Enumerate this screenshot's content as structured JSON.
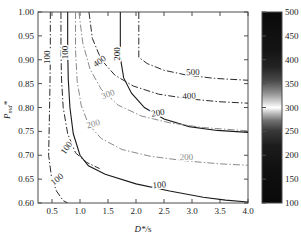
{
  "figure": {
    "background": "#ffffff",
    "axes_color": "#4d4d4d"
  },
  "chart_data": {
    "type": "line",
    "subtype": "contour",
    "title": "",
    "xlabel": "D*/s",
    "ylabel": "Pmd*",
    "xlim": [
      0.25,
      4.0
    ],
    "ylim": [
      0.6,
      1.0
    ],
    "grid": false,
    "xticks": [
      0.5,
      1.0,
      1.5,
      2.0,
      2.5,
      3.0,
      3.5,
      4.0
    ],
    "xtick_labels": [
      "0.5",
      "1.0",
      "1.5",
      "2.0",
      "2.5",
      "3.0",
      "3.5",
      "4.0"
    ],
    "yticks": [
      0.6,
      0.65,
      0.7,
      0.75,
      0.8,
      0.85,
      0.9,
      0.95,
      1.0
    ],
    "ytick_labels": [
      "0.60",
      "0.65",
      "0.70",
      "0.75",
      "0.80",
      "0.85",
      "0.90",
      "0.95",
      "1.00"
    ],
    "colorbar": {
      "min": 100,
      "max": 500,
      "ticks": [
        100,
        150,
        200,
        250,
        300,
        350,
        400,
        450,
        500
      ],
      "tick_labels": [
        "100",
        "150",
        "200",
        "250",
        "300",
        "350",
        "400",
        "450",
        "500"
      ],
      "colormap": "gray-banded",
      "highlight_value": 295
    },
    "series": [
      {
        "name": "contour-100-dashdot-left",
        "level": 100,
        "style": "dash-dot",
        "color": "#2b2b2b",
        "label": "100",
        "points": [
          [
            0.47,
            1.0
          ],
          [
            0.47,
            0.9
          ],
          [
            0.46,
            0.82
          ],
          [
            0.45,
            0.76
          ],
          [
            0.44,
            0.7
          ],
          [
            0.49,
            0.655
          ],
          [
            0.58,
            0.625
          ],
          [
            0.7,
            0.605
          ],
          [
            0.78,
            0.6
          ]
        ]
      },
      {
        "name": "contour-100-dashdot-mid",
        "level": 100,
        "style": "dash-dot",
        "color": "#2b2b2b",
        "label": "100",
        "points": [
          [
            0.66,
            1.0
          ],
          [
            0.66,
            0.92
          ],
          [
            0.67,
            0.86
          ],
          [
            0.7,
            0.8
          ],
          [
            0.78,
            0.745
          ],
          [
            0.92,
            0.705
          ],
          [
            1.12,
            0.685
          ],
          [
            1.35,
            0.672
          ]
        ]
      },
      {
        "name": "contour-100-solid",
        "level": 100,
        "style": "solid",
        "color": "#1a1a1a",
        "label": "100",
        "points": [
          [
            0.78,
            1.0
          ],
          [
            0.78,
            0.92
          ],
          [
            0.79,
            0.86
          ],
          [
            0.82,
            0.8
          ],
          [
            0.88,
            0.745
          ],
          [
            1.0,
            0.7
          ],
          [
            1.15,
            0.678
          ],
          [
            1.45,
            0.66
          ],
          [
            2.0,
            0.64
          ],
          [
            2.6,
            0.625
          ],
          [
            3.2,
            0.612
          ],
          [
            3.6,
            0.606
          ],
          [
            4.0,
            0.602
          ]
        ]
      },
      {
        "name": "contour-200-dashdot-light",
        "level": 200,
        "style": "dash-dot",
        "color": "#8a8a8a",
        "label": "200",
        "points": [
          [
            0.92,
            1.0
          ],
          [
            0.92,
            0.92
          ],
          [
            0.95,
            0.855
          ],
          [
            1.02,
            0.805
          ],
          [
            1.15,
            0.765
          ],
          [
            1.38,
            0.735
          ],
          [
            1.75,
            0.712
          ],
          [
            2.25,
            0.698
          ],
          [
            2.9,
            0.688
          ],
          [
            3.5,
            0.682
          ],
          [
            4.0,
            0.679
          ]
        ]
      },
      {
        "name": "contour-200-solid",
        "level": 200,
        "style": "solid",
        "color": "#1a1a1a",
        "label": "200",
        "points": [
          [
            1.72,
            1.0
          ],
          [
            1.72,
            0.905
          ],
          [
            1.78,
            0.862
          ],
          [
            1.92,
            0.83
          ],
          [
            2.15,
            0.8
          ],
          [
            2.5,
            0.776
          ],
          [
            2.95,
            0.76
          ],
          [
            3.45,
            0.752
          ],
          [
            4.0,
            0.748
          ]
        ]
      },
      {
        "name": "contour-300-dashdot-light",
        "level": 300,
        "style": "dash-dot",
        "color": "#8a8a8a",
        "label": "300",
        "points": [
          [
            0.98,
            1.0
          ],
          [
            1.05,
            0.935
          ],
          [
            1.18,
            0.88
          ],
          [
            1.38,
            0.838
          ],
          [
            1.68,
            0.805
          ],
          [
            2.1,
            0.782
          ],
          [
            2.6,
            0.768
          ],
          [
            3.2,
            0.758
          ],
          [
            4.0,
            0.751
          ]
        ]
      },
      {
        "name": "contour-400-dashdot",
        "level": 400,
        "style": "dash-dot",
        "color": "#2b2b2b",
        "label": "400",
        "points": [
          [
            1.16,
            1.0
          ],
          [
            1.22,
            0.945
          ],
          [
            1.38,
            0.9
          ],
          [
            1.62,
            0.868
          ],
          [
            1.95,
            0.845
          ],
          [
            2.4,
            0.828
          ],
          [
            2.95,
            0.818
          ],
          [
            3.5,
            0.812
          ],
          [
            4.0,
            0.809
          ]
        ]
      },
      {
        "name": "contour-500-dashdot",
        "level": 500,
        "style": "dash-dot",
        "color": "#2b2b2b",
        "label": "500",
        "points": [
          [
            2.05,
            1.0
          ],
          [
            2.05,
            0.905
          ],
          [
            2.2,
            0.892
          ],
          [
            2.5,
            0.878
          ],
          [
            2.9,
            0.868
          ],
          [
            3.4,
            0.861
          ],
          [
            4.0,
            0.857
          ]
        ]
      }
    ],
    "contour_labels": [
      {
        "text": "100",
        "x": 0.46,
        "y": 0.905,
        "rotation": -90,
        "color": "#2b2b2b"
      },
      {
        "text": "100",
        "x": 0.8,
        "y": 0.712,
        "rotation": -55,
        "color": "#2b2b2b"
      },
      {
        "text": "100",
        "x": 0.62,
        "y": 0.645,
        "rotation": -38,
        "color": "#2b2b2b"
      },
      {
        "text": "100",
        "x": 0.78,
        "y": 0.915,
        "rotation": -90,
        "color": "#1a1a1a"
      },
      {
        "text": "100",
        "x": 2.42,
        "y": 0.632,
        "rotation": -4,
        "color": "#1a1a1a"
      },
      {
        "text": "200",
        "x": 1.25,
        "y": 0.76,
        "rotation": -16,
        "color": "#8a8a8a"
      },
      {
        "text": "200",
        "x": 2.9,
        "y": 0.69,
        "rotation": -2,
        "color": "#8a8a8a"
      },
      {
        "text": "200",
        "x": 1.72,
        "y": 0.912,
        "rotation": -90,
        "color": "#1a1a1a"
      },
      {
        "text": "200",
        "x": 2.4,
        "y": 0.783,
        "rotation": -9,
        "color": "#1a1a1a"
      },
      {
        "text": "300",
        "x": 1.52,
        "y": 0.822,
        "rotation": -22,
        "color": "#8a8a8a"
      },
      {
        "text": "400",
        "x": 1.38,
        "y": 0.892,
        "rotation": -36,
        "color": "#2b2b2b"
      },
      {
        "text": "400",
        "x": 2.95,
        "y": 0.818,
        "rotation": -3,
        "color": "#2b2b2b"
      },
      {
        "text": "500",
        "x": 3.02,
        "y": 0.868,
        "rotation": -2,
        "color": "#2b2b2b"
      }
    ]
  }
}
